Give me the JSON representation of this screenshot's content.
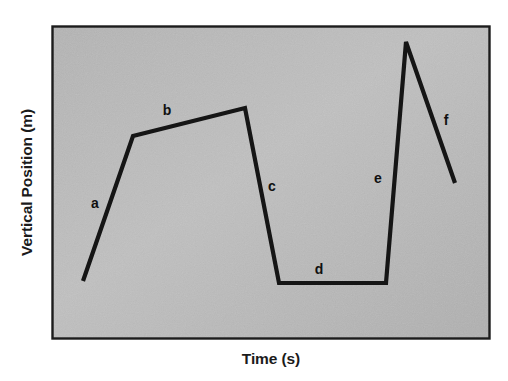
{
  "figure": {
    "background_color": "#ffffff",
    "plot_fill_color": "#b7b7b7",
    "plot_border_color": "#1c1c1c",
    "line_color": "#151515"
  },
  "chart_data": {
    "type": "line",
    "title": "",
    "xlabel": "Time (s)",
    "ylabel": "Vertical Position (m)",
    "xlim": [
      0,
      100
    ],
    "ylim": [
      0,
      100
    ],
    "grid": false,
    "legend": null,
    "axis_ticks": {
      "x": [],
      "y": []
    },
    "series": [
      {
        "name": "vertical position vs time",
        "x": [
          7.1,
          18.5,
          44.1,
          51.8,
          76.3,
          80.8,
          92.0
        ],
        "y": [
          18.5,
          64.9,
          73.8,
          17.9,
          17.9,
          94.9,
          49.8
        ]
      }
    ],
    "points_px": [
      {
        "x": 83,
        "y": 281
      },
      {
        "x": 133,
        "y": 136
      },
      {
        "x": 245,
        "y": 108
      },
      {
        "x": 279,
        "y": 283
      },
      {
        "x": 386,
        "y": 283
      },
      {
        "x": 406,
        "y": 42
      },
      {
        "x": 455,
        "y": 183
      }
    ],
    "annotations": [
      {
        "text": "a",
        "x_px": 95,
        "y_px": 203,
        "describes": "steep rising segment"
      },
      {
        "text": "b",
        "x_px": 167,
        "y_px": 110,
        "describes": "gently rising segment"
      },
      {
        "text": "c",
        "x_px": 272,
        "y_px": 186,
        "describes": "steep falling segment"
      },
      {
        "text": "d",
        "x_px": 319,
        "y_px": 269,
        "describes": "flat segment at low value"
      },
      {
        "text": "e",
        "x_px": 378,
        "y_px": 178,
        "describes": "very steep rising segment"
      },
      {
        "text": "f",
        "x_px": 446,
        "y_px": 120,
        "describes": "falling segment to end"
      }
    ]
  },
  "plot_area_px": {
    "left": 52,
    "top": 26,
    "right": 490,
    "bottom": 339,
    "width": 438,
    "height": 313
  }
}
